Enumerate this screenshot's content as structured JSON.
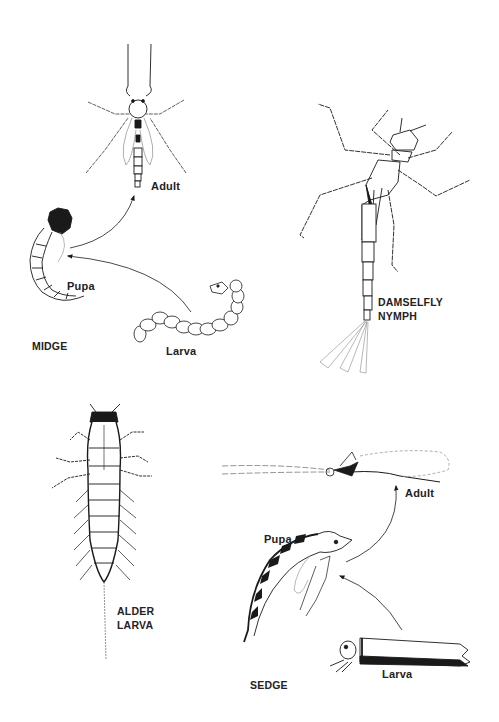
{
  "panels": [
    {
      "id": "midge",
      "title": "MIDGE",
      "stages": [
        {
          "name": "Adult"
        },
        {
          "name": "Pupa"
        },
        {
          "name": "Larva"
        }
      ],
      "flow": [
        "Larva",
        "Pupa",
        "Adult"
      ]
    },
    {
      "id": "damselfly",
      "title_lines": [
        "DAMSELFLY",
        "NYMPH"
      ]
    },
    {
      "id": "alder",
      "title_lines": [
        "ALDER",
        "LARVA"
      ]
    },
    {
      "id": "sedge",
      "title": "SEDGE",
      "stages": [
        {
          "name": "Adult"
        },
        {
          "name": "Pupa"
        },
        {
          "name": "Larva"
        }
      ],
      "flow": [
        "Larva",
        "Pupa",
        "Adult"
      ]
    }
  ],
  "colors": {
    "ink": "#1a1a1a",
    "paper": "#ffffff"
  }
}
